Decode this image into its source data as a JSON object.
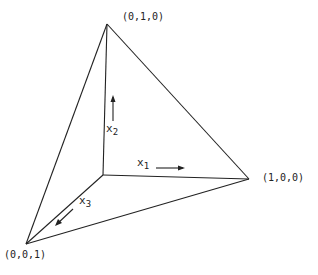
{
  "diagram": {
    "vertices": {
      "top": "(0,1,0)",
      "right": "(1,0,0)",
      "bottom_left": "(0,0,1)"
    },
    "axes": {
      "x1": {
        "base": "x",
        "sub": "1"
      },
      "x2": {
        "base": "x",
        "sub": "2"
      },
      "x3": {
        "base": "x",
        "sub": "3"
      }
    },
    "line_color": "#222222"
  }
}
